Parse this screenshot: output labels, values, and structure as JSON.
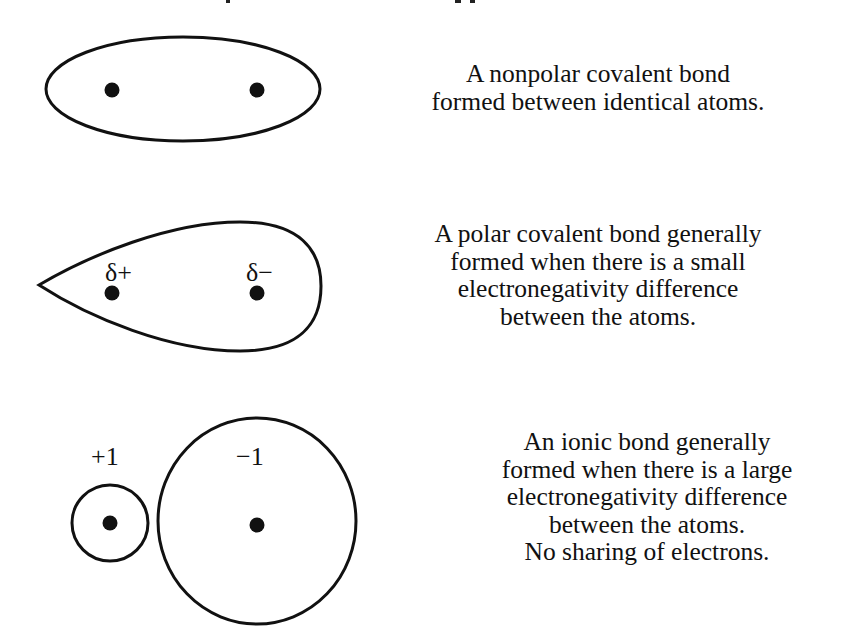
{
  "figure": {
    "colors": {
      "stroke": "#111111",
      "background": "#ffffff"
    },
    "panels": [
      {
        "id": "nonpolar",
        "shape": "ellipse",
        "atom_labels": [],
        "description_lines": [
          "A nonpolar covalent bond",
          "formed between identical atoms."
        ]
      },
      {
        "id": "polar",
        "shape": "teardrop",
        "atom_labels": [
          "δ+",
          "δ−"
        ],
        "description_lines": [
          "A polar covalent bond generally",
          "formed when there is a small",
          "electronegativity difference",
          "between the atoms."
        ]
      },
      {
        "id": "ionic",
        "shape": "two-circles",
        "atom_labels": [
          "+1",
          "−1"
        ],
        "description_lines": [
          "An ionic bond generally",
          "formed when there is a large",
          "electronegativity difference",
          "between the atoms.",
          "No sharing of electrons."
        ]
      }
    ]
  }
}
